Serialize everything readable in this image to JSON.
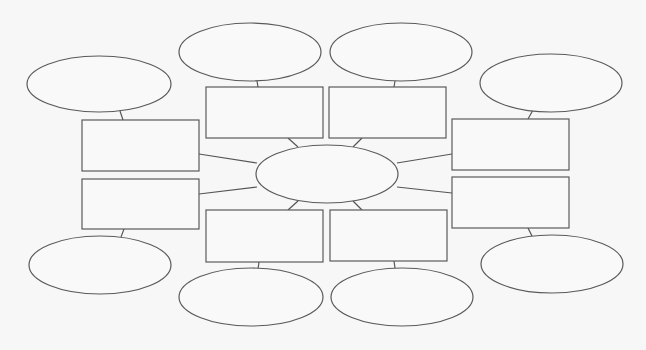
{
  "diagram": {
    "type": "concept-map",
    "width": 646,
    "height": 350,
    "colors": {
      "background": "#f7f7f7",
      "shape_fill": "#f9f9f9",
      "stroke": "#5a5a5a",
      "connector": "#555555"
    },
    "center": {
      "id": "center-ellipse",
      "cx": 327,
      "cy": 174,
      "rx": 71,
      "ry": 29,
      "text": ""
    },
    "boxes": [
      {
        "id": "box-top-left",
        "x": 206,
        "y": 87,
        "w": 117,
        "h": 51,
        "text": ""
      },
      {
        "id": "box-top-right",
        "x": 329,
        "y": 87,
        "w": 117,
        "h": 51,
        "text": ""
      },
      {
        "id": "box-left-upper",
        "x": 82,
        "y": 120,
        "w": 117,
        "h": 51,
        "text": ""
      },
      {
        "id": "box-left-lower",
        "x": 82,
        "y": 179,
        "w": 117,
        "h": 50,
        "text": ""
      },
      {
        "id": "box-right-upper",
        "x": 452,
        "y": 119,
        "w": 117,
        "h": 51,
        "text": ""
      },
      {
        "id": "box-right-lower",
        "x": 452,
        "y": 177,
        "w": 117,
        "h": 51,
        "text": ""
      },
      {
        "id": "box-bottom-left",
        "x": 206,
        "y": 210,
        "w": 117,
        "h": 52,
        "text": ""
      },
      {
        "id": "box-bottom-right",
        "x": 330,
        "y": 210,
        "w": 117,
        "h": 51,
        "text": ""
      }
    ],
    "ellipses": [
      {
        "id": "ellipse-top-left",
        "cx": 250,
        "cy": 52,
        "rx": 71,
        "ry": 29,
        "text": ""
      },
      {
        "id": "ellipse-top-right",
        "cx": 401,
        "cy": 52,
        "rx": 71,
        "ry": 29,
        "text": ""
      },
      {
        "id": "ellipse-far-left-top",
        "cx": 99,
        "cy": 84,
        "rx": 72,
        "ry": 28,
        "text": ""
      },
      {
        "id": "ellipse-far-right-top",
        "cx": 551,
        "cy": 83,
        "rx": 71,
        "ry": 29,
        "text": ""
      },
      {
        "id": "ellipse-far-left-bottom",
        "cx": 100,
        "cy": 265,
        "rx": 71,
        "ry": 29,
        "text": ""
      },
      {
        "id": "ellipse-far-right-bottom",
        "cx": 552,
        "cy": 264,
        "rx": 71,
        "ry": 29,
        "text": ""
      },
      {
        "id": "ellipse-bottom-left",
        "cx": 251,
        "cy": 297,
        "rx": 72,
        "ry": 29,
        "text": ""
      },
      {
        "id": "ellipse-bottom-right",
        "cx": 402,
        "cy": 297,
        "rx": 71,
        "ry": 29,
        "text": ""
      }
    ],
    "connectors": [
      {
        "from": "box-top-left",
        "to": "center-ellipse",
        "x1": 288,
        "y1": 138,
        "x2": 298,
        "y2": 147
      },
      {
        "from": "box-top-right",
        "to": "center-ellipse",
        "x1": 362,
        "y1": 138,
        "x2": 353,
        "y2": 147
      },
      {
        "from": "box-bottom-left",
        "to": "center-ellipse",
        "x1": 288,
        "y1": 210,
        "x2": 298,
        "y2": 201
      },
      {
        "from": "box-bottom-right",
        "to": "center-ellipse",
        "x1": 362,
        "y1": 210,
        "x2": 353,
        "y2": 201
      },
      {
        "from": "box-left-upper",
        "to": "center-ellipse",
        "x1": 199,
        "y1": 154,
        "x2": 257,
        "y2": 163
      },
      {
        "from": "box-left-lower",
        "to": "center-ellipse",
        "x1": 199,
        "y1": 194,
        "x2": 257,
        "y2": 187
      },
      {
        "from": "box-right-upper",
        "to": "center-ellipse",
        "x1": 452,
        "y1": 154,
        "x2": 397,
        "y2": 163
      },
      {
        "from": "box-right-lower",
        "to": "center-ellipse",
        "x1": 452,
        "y1": 193,
        "x2": 397,
        "y2": 187
      },
      {
        "from": "ellipse-top-left",
        "to": "box-top-left",
        "x1": 257,
        "y1": 81,
        "x2": 258,
        "y2": 87
      },
      {
        "from": "ellipse-top-right",
        "to": "box-top-right",
        "x1": 395,
        "y1": 81,
        "x2": 394,
        "y2": 87
      },
      {
        "from": "ellipse-far-left-top",
        "to": "box-left-upper",
        "x1": 120,
        "y1": 111,
        "x2": 123,
        "y2": 120
      },
      {
        "from": "ellipse-far-right-top",
        "to": "box-right-upper",
        "x1": 533,
        "y1": 110,
        "x2": 528,
        "y2": 119
      },
      {
        "from": "box-left-lower",
        "to": "ellipse-far-left-bottom",
        "x1": 124,
        "y1": 229,
        "x2": 121,
        "y2": 237
      },
      {
        "from": "box-right-lower",
        "to": "ellipse-far-right-bottom",
        "x1": 528,
        "y1": 228,
        "x2": 532,
        "y2": 236
      },
      {
        "from": "box-bottom-left",
        "to": "ellipse-bottom-left",
        "x1": 259,
        "y1": 262,
        "x2": 258,
        "y2": 269
      },
      {
        "from": "box-bottom-right",
        "to": "ellipse-bottom-right",
        "x1": 394,
        "y1": 261,
        "x2": 395,
        "y2": 268
      }
    ]
  }
}
